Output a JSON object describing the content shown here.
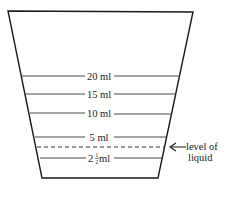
{
  "diagram": {
    "container": {
      "shape": "trapezoid",
      "top_left": [
        8,
        11
      ],
      "top_right": [
        193,
        12
      ],
      "bottom_right": [
        158,
        178
      ],
      "bottom_left": [
        42,
        178
      ],
      "stroke": "#1a1a1a"
    },
    "graduations": [
      {
        "label": "20 ml",
        "y": 76
      },
      {
        "label": "15 ml",
        "y": 94
      },
      {
        "label": "10 ml",
        "y": 113
      },
      {
        "label": "5 ml",
        "y": 137
      },
      {
        "label_whole": "2",
        "label_frac_num": "1",
        "label_frac_den": "2",
        "label_unit": " ml",
        "y": 158
      }
    ],
    "liquid_level": {
      "y": 147,
      "style": "dashed",
      "annotation_line1": "level of",
      "annotation_line2": "liquid"
    }
  }
}
